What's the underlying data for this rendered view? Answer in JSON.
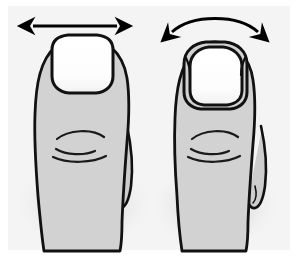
{
  "figure": {
    "type": "medical-illustration",
    "panel_count": 2,
    "labels": [],
    "caption": ""
  },
  "colors": {
    "page_background": "#ffffff",
    "panel_background": "#f4f4f4",
    "skin_fill": "#d2d2d2",
    "skin_fill_shadow": "#c6c6c6",
    "nail_fill": "#ffffff",
    "nail_fill_shade": "#f7f7f7",
    "outline": "#111111",
    "arrow": "#000000",
    "crease": "#1a1a1a",
    "shadow": "#e3e3e3"
  },
  "geometry": {
    "canvas_width": 298,
    "canvas_height": 256,
    "panel": {
      "x": 8,
      "y": 6,
      "width": 282,
      "height": 244
    },
    "left_panel_center_x": 82,
    "right_panel_center_x": 215
  },
  "panels": [
    {
      "id": "left",
      "name": "normal-flat-toenail",
      "title": "Normal flat toenail",
      "arrow": {
        "name": "straight-double-arrow",
        "style": "straight",
        "meaning": "nail plate width measured across a flat nail",
        "x1": 33,
        "x2": 117,
        "y": 26,
        "head_size": 9,
        "stroke_width": 3
      },
      "nail": {
        "name": "flat-wide-nail",
        "shape": "broad rounded square",
        "width": 64,
        "height": 58,
        "curvature": "flat",
        "has_nail_folds": false
      },
      "toe": {
        "name": "great-toe",
        "width": "broad",
        "creases": 3
      },
      "second_toe": {
        "present": true,
        "side": "right"
      }
    },
    {
      "id": "right",
      "name": "curved-pincer-toenail",
      "title": "Curved (pincer) toenail",
      "arrow": {
        "name": "curved-double-arrow",
        "style": "arched",
        "meaning": "transverse over-curvature of the nail plate",
        "x1": 172,
        "x2": 258,
        "y": 32,
        "arc_height": 15,
        "head_size": 9,
        "stroke_width": 3
      },
      "nail": {
        "name": "curved-narrow-nail",
        "shape": "tall rounded dome, pinched at sides",
        "width": 52,
        "height": 58,
        "curvature": "over-curved",
        "has_nail_folds": true
      },
      "toe": {
        "name": "great-toe",
        "width": "narrow",
        "creases": 3
      },
      "second_toe": {
        "present": true,
        "side": "right"
      }
    }
  ]
}
